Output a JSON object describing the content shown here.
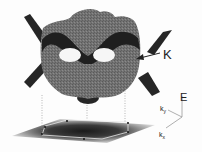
{
  "figure": {
    "labels": {
      "k_point": "K",
      "energy_axis": "E",
      "ky_axis": "k",
      "ky_sub": "y",
      "kx_axis": "k",
      "kx_sub": "x"
    },
    "colors": {
      "surface": "#6e6e6e",
      "dark_band": "#1e1e1e",
      "plane_center": "#222222",
      "plane_edge": "#d8d8d8",
      "axis": "#9a9a9a",
      "background": "#fdfdfd"
    }
  }
}
